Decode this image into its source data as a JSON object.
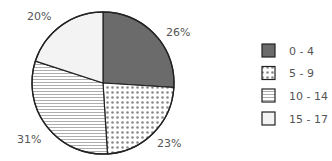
{
  "chart_data": {
    "type": "pie",
    "title": "",
    "categories": [
      "0 - 4",
      "5 - 9",
      "10 - 14",
      "15 - 17"
    ],
    "values": [
      26,
      23,
      31,
      20
    ],
    "unit": "%",
    "labels": [
      "26%",
      "23%",
      "31%",
      "20%"
    ],
    "start_angle_deg": 0,
    "direction": "clockwise from 12 o'clock",
    "legend_position": "right",
    "patterns": [
      "solid-dark-gray",
      "dots",
      "horizontal-lines",
      "light-solid"
    ]
  },
  "colors": {
    "slice_dark": "#6b6b6b",
    "dots": "#8a8a8a",
    "lines": "#9a9a9a",
    "light": "#f3f3f3",
    "outline": "#222222",
    "text": "#555555"
  }
}
